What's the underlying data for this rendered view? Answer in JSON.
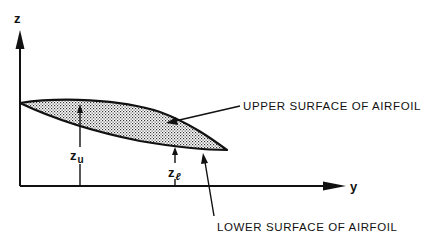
{
  "diagram": {
    "axes": {
      "vertical_label": "z",
      "horizontal_label": "y"
    },
    "dimensions": {
      "upper": {
        "symbol": "z",
        "subscript": "u"
      },
      "lower": {
        "symbol": "z",
        "subscript": "ℓ"
      }
    },
    "callouts": {
      "upper_surface": "UPPER SURFACE OF AIRFOIL",
      "lower_surface": "LOWER SURFACE OF AIRFOIL"
    },
    "colors": {
      "ink": "#111111",
      "background": "#ffffff",
      "fill_pattern": "stipple"
    }
  }
}
